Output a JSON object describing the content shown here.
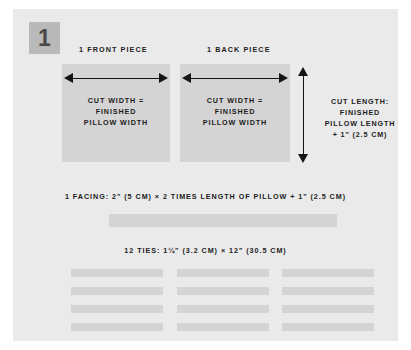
{
  "step": {
    "number": "1"
  },
  "pieces": [
    {
      "label": "1 FRONT PIECE",
      "text_line1": "CUT WIDTH =",
      "text_line2": "FINISHED",
      "text_line3": "PILLOW WIDTH"
    },
    {
      "label": "1 BACK PIECE",
      "text_line1": "CUT WIDTH =",
      "text_line2": "FINISHED",
      "text_line3": "PILLOW WIDTH"
    }
  ],
  "cut_length": {
    "line1": "CUT LENGTH:",
    "line2": "FINISHED",
    "line3": "PILLOW LENGTH",
    "line4": "+ 1\" (2.5 CM)"
  },
  "facing": {
    "label": "1 FACING: 2\" (5 CM) × 2 TIMES LENGTH OF PILLOW + 1\" (2.5 CM)"
  },
  "ties": {
    "label": "12 TIES: 1¼\" (3.2 CM) × 12\" (30.5 CM)",
    "count": 12,
    "columns": 3,
    "rows": 4
  },
  "colors": {
    "page_background": "#ffffff",
    "panel_background": "#eaeaea",
    "fabric_fill": "#d4d4d4",
    "badge_fill": "#b9b9b9",
    "badge_number": "#4a4a4a",
    "text": "#1c1c1c",
    "arrow": "#141414"
  }
}
